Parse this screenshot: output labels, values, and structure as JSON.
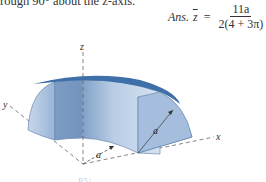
{
  "header": {
    "problem_text_fragment": "rough 90° about the z-axis."
  },
  "answer": {
    "label": "Ans.",
    "variable": "z",
    "equals": "=",
    "numerator": "11a",
    "denominator": "2(4 + 3π)"
  },
  "figure": {
    "axis_labels": {
      "x": "x",
      "y": "y",
      "z": "z"
    },
    "dimension_labels": [
      "a",
      "a"
    ],
    "colors": {
      "top_face": "#3f6fa8",
      "front_face_light": "#c9d9ec",
      "front_face_dark": "#7f9fc6",
      "side_face": "#6f90bb",
      "axis_line": "#666666"
    }
  },
  "caption": {
    "text": "P5/…"
  }
}
